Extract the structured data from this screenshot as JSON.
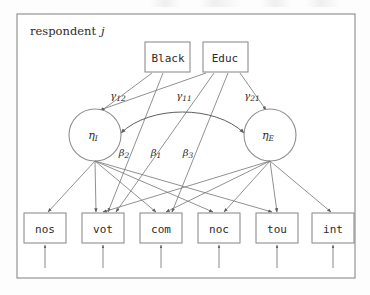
{
  "figure": {
    "type": "sem-path-diagram",
    "plate_label_text": "respondent",
    "plate_label_index": "j"
  },
  "exogenous": [
    {
      "id": "black",
      "label": "Black",
      "x": 168,
      "y": 57
    },
    {
      "id": "educ",
      "label": "Educ",
      "x": 225,
      "y": 57
    }
  ],
  "latent": [
    {
      "id": "eta_i",
      "label": "η",
      "subscript": "I",
      "cx": 95,
      "cy": 135,
      "r": 26
    },
    {
      "id": "eta_e",
      "label": "η",
      "subscript": "E",
      "cx": 270,
      "cy": 135,
      "r": 26
    }
  ],
  "indicators": [
    {
      "id": "nos",
      "label": "nos",
      "cx": 45,
      "cy": 228
    },
    {
      "id": "vot",
      "label": "vot",
      "cx": 103,
      "cy": 228
    },
    {
      "id": "com",
      "label": "com",
      "cx": 161,
      "cy": 228
    },
    {
      "id": "noc",
      "label": "noc",
      "cx": 219,
      "cy": 228
    },
    {
      "id": "tou",
      "label": "tou",
      "cx": 277,
      "cy": 228
    },
    {
      "id": "int",
      "label": "int",
      "cx": 333,
      "cy": 228
    }
  ],
  "coefficients": [
    {
      "id": "gamma12",
      "sym": "γ",
      "sub": "12",
      "x": 118,
      "y": 95,
      "from": "educ",
      "to": "eta_i"
    },
    {
      "id": "gamma11",
      "sym": "γ",
      "sub": "11",
      "x": 184,
      "y": 95,
      "from": "black",
      "to": "eta_i"
    },
    {
      "id": "gamma21",
      "sym": "γ",
      "sub": "21",
      "x": 252,
      "y": 95,
      "from": "educ",
      "to": "eta_e"
    },
    {
      "id": "beta2",
      "sym": "β",
      "sub": "2",
      "x": 124,
      "y": 152,
      "from": "black",
      "to": "vot"
    },
    {
      "id": "beta1",
      "sym": "β",
      "sub": "1",
      "x": 156,
      "y": 152,
      "from": "educ",
      "to": "vot"
    },
    {
      "id": "beta3",
      "sym": "β",
      "sub": "3",
      "x": 188,
      "y": 152,
      "from": "educ",
      "to": "com"
    }
  ],
  "colors": {
    "background": "#fdfdfd",
    "stroke": "#7d7d7d",
    "frame": "#8a8a8a",
    "text": "#2b2b2b"
  }
}
